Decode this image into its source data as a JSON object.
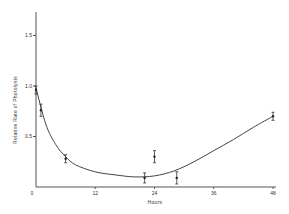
{
  "chart_data": {
    "type": "scatter",
    "title": "",
    "xlabel": "Hours",
    "ylabel": "Relative Rate of Photolysis",
    "xlim": [
      0,
      48
    ],
    "ylim": [
      0,
      1.75
    ],
    "x_ticks": [
      0,
      12,
      24,
      36,
      48
    ],
    "x_tick_labels": [
      "0",
      "12",
      "24",
      "36",
      "48"
    ],
    "y_ticks": [
      0.5,
      1.0,
      1.5
    ],
    "y_tick_labels": [
      "0.5",
      "1.0",
      "1.5"
    ],
    "grid": false,
    "legend": null,
    "series": [
      {
        "name": "Measured",
        "x": [
          0,
          1,
          6,
          22,
          24,
          28.5,
          48
        ],
        "y": [
          0.96,
          0.76,
          0.28,
          0.09,
          0.3,
          0.09,
          0.7
        ],
        "error": [
          0.04,
          0.06,
          0.04,
          0.05,
          0.06,
          0.06,
          0.04
        ]
      },
      {
        "name": "Fitted curve",
        "style": "line",
        "x": [
          0,
          2,
          4,
          6,
          8,
          12,
          16,
          20,
          24,
          28,
          32,
          36,
          40,
          44,
          48
        ],
        "y": [
          0.98,
          0.62,
          0.42,
          0.3,
          0.22,
          0.15,
          0.12,
          0.1,
          0.11,
          0.16,
          0.25,
          0.36,
          0.47,
          0.59,
          0.7
        ]
      }
    ]
  }
}
